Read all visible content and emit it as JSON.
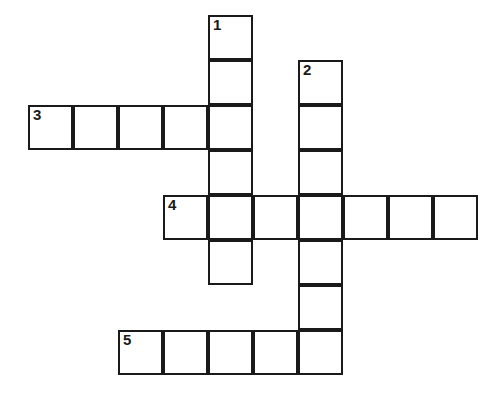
{
  "puzzle": {
    "title": "Crossword Puzzle Grid",
    "background_color": "#ffffff",
    "cell_border_color": "#1a1a1a",
    "cell_fill_color": "#ffffff",
    "cell_size_px": 45,
    "border_width_px": 2.5,
    "origin_x_px": 28,
    "origin_y_px": 15,
    "grid_columns": 10,
    "grid_rows": 8,
    "number_font_size_px": 15
  },
  "entries": [
    {
      "number": "1",
      "direction": "down",
      "length": 6,
      "start_col": 4,
      "start_row": 0,
      "label": "1 Down"
    },
    {
      "number": "2",
      "direction": "down",
      "length": 7,
      "start_col": 6,
      "start_row": 1,
      "label": "2 Down"
    },
    {
      "number": "3",
      "direction": "across",
      "length": 5,
      "start_col": 0,
      "start_row": 2,
      "label": "3 Across"
    },
    {
      "number": "4",
      "direction": "across",
      "length": 7,
      "start_col": 3,
      "start_row": 4,
      "label": "4 Across"
    },
    {
      "number": "5",
      "direction": "across",
      "length": 5,
      "start_col": 2,
      "start_row": 7,
      "label": "5 Across"
    }
  ],
  "cells": [
    {
      "col": 4,
      "row": 0,
      "number": "1",
      "value": ""
    },
    {
      "col": 4,
      "row": 1,
      "number": "",
      "value": ""
    },
    {
      "col": 6,
      "row": 1,
      "number": "2",
      "value": ""
    },
    {
      "col": 0,
      "row": 2,
      "number": "3",
      "value": ""
    },
    {
      "col": 1,
      "row": 2,
      "number": "",
      "value": ""
    },
    {
      "col": 2,
      "row": 2,
      "number": "",
      "value": ""
    },
    {
      "col": 3,
      "row": 2,
      "number": "",
      "value": ""
    },
    {
      "col": 4,
      "row": 2,
      "number": "",
      "value": ""
    },
    {
      "col": 6,
      "row": 2,
      "number": "",
      "value": ""
    },
    {
      "col": 4,
      "row": 3,
      "number": "",
      "value": ""
    },
    {
      "col": 6,
      "row": 3,
      "number": "",
      "value": ""
    },
    {
      "col": 3,
      "row": 4,
      "number": "4",
      "value": ""
    },
    {
      "col": 4,
      "row": 4,
      "number": "",
      "value": ""
    },
    {
      "col": 5,
      "row": 4,
      "number": "",
      "value": ""
    },
    {
      "col": 6,
      "row": 4,
      "number": "",
      "value": ""
    },
    {
      "col": 7,
      "row": 4,
      "number": "",
      "value": ""
    },
    {
      "col": 8,
      "row": 4,
      "number": "",
      "value": ""
    },
    {
      "col": 9,
      "row": 4,
      "number": "",
      "value": ""
    },
    {
      "col": 4,
      "row": 5,
      "number": "",
      "value": ""
    },
    {
      "col": 6,
      "row": 5,
      "number": "",
      "value": ""
    },
    {
      "col": 6,
      "row": 6,
      "number": "",
      "value": ""
    },
    {
      "col": 2,
      "row": 7,
      "number": "5",
      "value": ""
    },
    {
      "col": 3,
      "row": 7,
      "number": "",
      "value": ""
    },
    {
      "col": 4,
      "row": 7,
      "number": "",
      "value": ""
    },
    {
      "col": 5,
      "row": 7,
      "number": "",
      "value": ""
    },
    {
      "col": 6,
      "row": 7,
      "number": "",
      "value": ""
    }
  ]
}
